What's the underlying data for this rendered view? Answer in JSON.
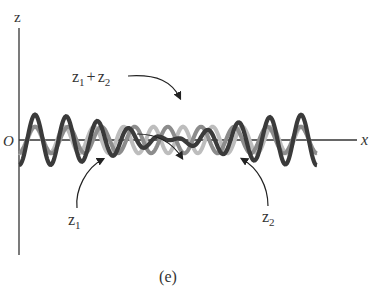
{
  "figure": {
    "caption": "(e)",
    "axes": {
      "z_label": "z",
      "x_label": "x",
      "origin_label": "O"
    },
    "labels": {
      "sum": {
        "base1": "z",
        "sub1": "1",
        "plus": "+",
        "base2": "z",
        "sub2": "2"
      },
      "z1": {
        "base": "z",
        "sub": "1"
      },
      "z2": {
        "base": "z",
        "sub": "2"
      }
    },
    "colors": {
      "axis": "#333333",
      "sum_wave": "#3a3a3a",
      "z1_wave": "#8c8c8c",
      "z2_wave": "#bdbdbd",
      "arrow": "#222222"
    }
  },
  "waves": {
    "x_start": 19,
    "x_end": 317,
    "baseline_y": 140,
    "amplitude": 19,
    "z1_wavelength": 33.2,
    "z2_wavelength": 29.6,
    "phase_x": 35
  }
}
